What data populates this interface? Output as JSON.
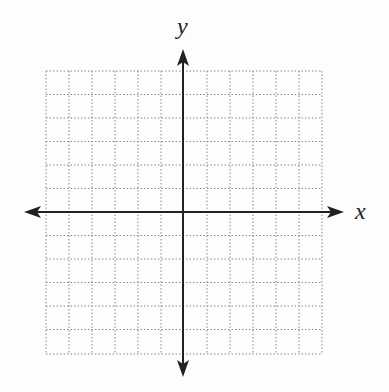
{
  "diagram": {
    "type": "coordinate-plane",
    "x_axis_label": "x",
    "y_axis_label": "y",
    "grid": {
      "columns": 12,
      "rows": 12,
      "line_style": "dotted",
      "line_color": "#888888"
    },
    "axis_color": "#222222"
  }
}
